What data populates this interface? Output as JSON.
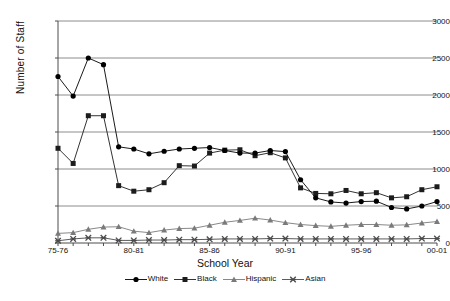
{
  "chart_data": {
    "type": "line",
    "title": "",
    "xlabel": "School Year",
    "ylabel": "Number of Staff",
    "ylim": [
      0,
      3000
    ],
    "yticks": [
      0,
      500,
      1000,
      1500,
      2000,
      2500,
      3000
    ],
    "grid": true,
    "legend_position": "bottom",
    "categories": [
      "75-76",
      "76-77",
      "77-78",
      "78-79",
      "79-80",
      "80-81",
      "81-82",
      "82-83",
      "83-84",
      "84-85",
      "85-86",
      "86-87",
      "87-88",
      "88-89",
      "89-90",
      "90-91",
      "91-92",
      "92-93",
      "93-94",
      "94-95",
      "95-96",
      "96-97",
      "97-98",
      "98-99",
      "99-00",
      "00-01"
    ],
    "tick_labels": [
      "75-76",
      "80-81",
      "85-86",
      "90-91",
      "95-96",
      "00-01"
    ],
    "tick_indices": [
      0,
      5,
      10,
      15,
      20,
      25
    ],
    "series": [
      {
        "name": "White",
        "marker": "circle",
        "color": "#000000",
        "values": [
          2250,
          1985,
          2500,
          2410,
          1300,
          1270,
          1205,
          1240,
          1270,
          1280,
          1290,
          1250,
          1215,
          1215,
          1250,
          1235,
          855,
          610,
          555,
          540,
          560,
          565,
          480,
          460,
          500,
          560
        ]
      },
      {
        "name": "Black",
        "marker": "square",
        "color": "#1c1c1c",
        "values": [
          1280,
          1075,
          1720,
          1720,
          775,
          700,
          720,
          815,
          1045,
          1040,
          1215,
          1255,
          1260,
          1180,
          1220,
          1150,
          745,
          670,
          665,
          710,
          665,
          680,
          610,
          625,
          720,
          760
        ]
      },
      {
        "name": "Hispanic",
        "marker": "triangle",
        "color": "#7a7a7a",
        "values": [
          130,
          140,
          185,
          215,
          220,
          160,
          140,
          175,
          195,
          200,
          240,
          280,
          305,
          335,
          310,
          275,
          250,
          235,
          225,
          240,
          250,
          250,
          240,
          245,
          270,
          290
        ]
      },
      {
        "name": "Asian",
        "marker": "cross",
        "color": "#4a4a4a",
        "values": [
          30,
          55,
          70,
          70,
          35,
          35,
          40,
          40,
          45,
          45,
          50,
          55,
          55,
          55,
          60,
          60,
          55,
          55,
          55,
          55,
          55,
          55,
          55,
          55,
          60,
          60
        ]
      }
    ]
  },
  "legend": {
    "items": [
      {
        "label": "White"
      },
      {
        "label": "Black"
      },
      {
        "label": "Hispanic"
      },
      {
        "label": "Asian"
      }
    ]
  },
  "caption": {
    "text": ""
  }
}
